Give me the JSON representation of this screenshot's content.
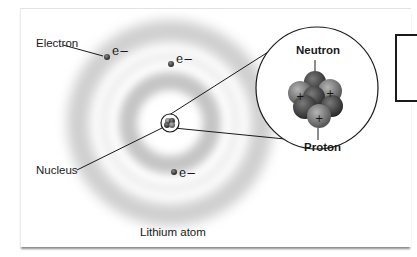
{
  "diagram": {
    "title": "Lithium atom",
    "labels": {
      "electron": "Electron",
      "nucleus": "Nucleus",
      "neutron": "Neutron",
      "proton": "Proton"
    },
    "electrons": [
      {
        "symbol": "e−",
        "x": 107,
        "y": 57
      },
      {
        "symbol": "e−",
        "x": 171,
        "y": 64
      },
      {
        "symbol": "e−",
        "x": 174,
        "y": 172
      }
    ],
    "nucleus_particles": {
      "protons": 3,
      "neutrons": 4,
      "proton_symbol": "+"
    },
    "colors": {
      "orbital": "#b8b8b8",
      "particle_dark": "#3a3a3a",
      "particle_light": "#8c8c8c",
      "line": "#1a1a1a"
    }
  }
}
